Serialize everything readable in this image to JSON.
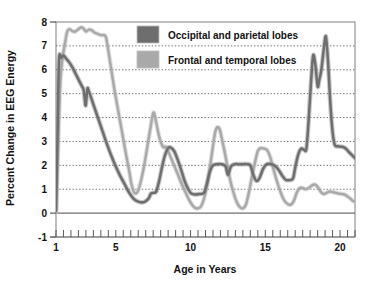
{
  "chart_data": {
    "type": "line",
    "title": "",
    "xlabel": "Age in Years",
    "ylabel": "Percent Change in EEG Energy",
    "xlim": [
      1,
      21
    ],
    "ylim": [
      -1,
      8
    ],
    "yticks": [
      -1,
      0,
      1,
      2,
      3,
      4,
      5,
      6,
      7,
      8
    ],
    "ytick_labels": [
      "-1",
      "0",
      "1",
      "2",
      "3",
      "4",
      "5",
      "6",
      "7",
      "8"
    ],
    "xticks": [
      1,
      5,
      10,
      15,
      20
    ],
    "xtick_labels": [
      "1",
      "5",
      "10",
      "15",
      "20"
    ],
    "x_minor_tick_step": 0.5,
    "grid": "horizontal-dotted",
    "legend_position": "top-center",
    "series": [
      {
        "name": "Occipital and parietal lobes",
        "color": "#6e6e6e",
        "halo_color": "#9a9a9a",
        "points": [
          [
            1.0,
            0.1
          ],
          [
            1.1,
            3.2
          ],
          [
            1.2,
            6.4
          ],
          [
            1.35,
            6.5
          ],
          [
            1.5,
            6.6
          ],
          [
            1.7,
            6.45
          ],
          [
            1.9,
            6.3
          ],
          [
            2.1,
            6.1
          ],
          [
            2.3,
            5.85
          ],
          [
            2.5,
            5.6
          ],
          [
            2.7,
            5.35
          ],
          [
            2.85,
            5.15
          ],
          [
            2.95,
            4.6
          ],
          [
            3.0,
            4.55
          ],
          [
            3.1,
            5.2
          ],
          [
            3.2,
            5.1
          ],
          [
            3.5,
            4.55
          ],
          [
            3.8,
            4.0
          ],
          [
            4.1,
            3.45
          ],
          [
            4.4,
            2.9
          ],
          [
            4.7,
            2.4
          ],
          [
            5.0,
            1.95
          ],
          [
            5.3,
            1.55
          ],
          [
            5.6,
            1.2
          ],
          [
            5.9,
            0.85
          ],
          [
            6.2,
            0.6
          ],
          [
            6.5,
            0.48
          ],
          [
            6.8,
            0.45
          ],
          [
            7.0,
            0.5
          ],
          [
            7.2,
            0.62
          ],
          [
            7.35,
            0.82
          ],
          [
            7.5,
            0.85
          ],
          [
            7.7,
            0.9
          ],
          [
            7.9,
            1.35
          ],
          [
            8.1,
            1.95
          ],
          [
            8.3,
            2.45
          ],
          [
            8.5,
            2.72
          ],
          [
            8.65,
            2.75
          ],
          [
            8.9,
            2.6
          ],
          [
            9.1,
            2.3
          ],
          [
            9.35,
            1.85
          ],
          [
            9.6,
            1.35
          ],
          [
            9.85,
            1.0
          ],
          [
            10.05,
            0.82
          ],
          [
            10.3,
            0.78
          ],
          [
            10.6,
            0.8
          ],
          [
            10.9,
            0.85
          ],
          [
            11.1,
            1.25
          ],
          [
            11.3,
            1.75
          ],
          [
            11.5,
            2.0
          ],
          [
            11.8,
            2.05
          ],
          [
            12.1,
            2.05
          ],
          [
            12.35,
            1.95
          ],
          [
            12.5,
            1.6
          ],
          [
            12.7,
            1.95
          ],
          [
            12.95,
            2.05
          ],
          [
            13.2,
            2.05
          ],
          [
            13.5,
            2.05
          ],
          [
            13.8,
            2.05
          ],
          [
            14.0,
            2.0
          ],
          [
            14.2,
            1.6
          ],
          [
            14.4,
            1.35
          ],
          [
            14.6,
            1.45
          ],
          [
            14.85,
            1.85
          ],
          [
            15.1,
            2.05
          ],
          [
            15.35,
            2.05
          ],
          [
            15.6,
            2.0
          ],
          [
            15.85,
            1.85
          ],
          [
            16.1,
            1.6
          ],
          [
            16.35,
            1.4
          ],
          [
            16.6,
            1.38
          ],
          [
            16.85,
            1.45
          ],
          [
            17.0,
            1.9
          ],
          [
            17.2,
            2.45
          ],
          [
            17.4,
            2.7
          ],
          [
            17.6,
            2.65
          ],
          [
            17.75,
            2.7
          ],
          [
            17.9,
            3.9
          ],
          [
            18.05,
            5.4
          ],
          [
            18.2,
            6.6
          ],
          [
            18.35,
            6.2
          ],
          [
            18.5,
            5.3
          ],
          [
            18.62,
            5.6
          ],
          [
            18.75,
            6.0
          ],
          [
            18.9,
            6.8
          ],
          [
            19.05,
            7.4
          ],
          [
            19.2,
            6.3
          ],
          [
            19.35,
            4.6
          ],
          [
            19.5,
            3.4
          ],
          [
            19.65,
            2.85
          ],
          [
            19.85,
            2.8
          ],
          [
            20.1,
            2.78
          ],
          [
            20.35,
            2.72
          ],
          [
            20.6,
            2.55
          ],
          [
            20.85,
            2.4
          ],
          [
            21.0,
            2.3
          ]
        ]
      },
      {
        "name": "Frontal and temporal lobes",
        "color": "#a9a9a9",
        "halo_color": "#c8c8c8",
        "points": [
          [
            1.0,
            0.05
          ],
          [
            1.1,
            2.0
          ],
          [
            1.2,
            4.0
          ],
          [
            1.3,
            5.6
          ],
          [
            1.45,
            6.55
          ],
          [
            1.6,
            7.1
          ],
          [
            1.75,
            7.6
          ],
          [
            1.9,
            7.7
          ],
          [
            2.1,
            7.62
          ],
          [
            2.3,
            7.6
          ],
          [
            2.5,
            7.7
          ],
          [
            2.7,
            7.78
          ],
          [
            2.85,
            7.72
          ],
          [
            3.0,
            7.6
          ],
          [
            3.2,
            7.68
          ],
          [
            3.4,
            7.65
          ],
          [
            3.6,
            7.55
          ],
          [
            3.8,
            7.5
          ],
          [
            4.0,
            7.45
          ],
          [
            4.2,
            7.45
          ],
          [
            4.35,
            7.35
          ],
          [
            4.5,
            6.8
          ],
          [
            4.7,
            6.0
          ],
          [
            4.9,
            5.2
          ],
          [
            5.1,
            4.5
          ],
          [
            5.3,
            3.8
          ],
          [
            5.5,
            3.1
          ],
          [
            5.7,
            2.4
          ],
          [
            5.9,
            1.75
          ],
          [
            6.05,
            1.2
          ],
          [
            6.2,
            0.9
          ],
          [
            6.35,
            0.82
          ],
          [
            6.5,
            0.95
          ],
          [
            6.7,
            1.4
          ],
          [
            6.9,
            2.0
          ],
          [
            7.1,
            2.75
          ],
          [
            7.3,
            3.5
          ],
          [
            7.45,
            4.05
          ],
          [
            7.55,
            4.2
          ],
          [
            7.7,
            3.8
          ],
          [
            7.9,
            3.2
          ],
          [
            8.05,
            2.9
          ],
          [
            8.2,
            2.75
          ],
          [
            8.35,
            2.78
          ],
          [
            8.5,
            2.6
          ],
          [
            8.7,
            2.3
          ],
          [
            8.9,
            2.0
          ],
          [
            9.1,
            1.7
          ],
          [
            9.35,
            1.3
          ],
          [
            9.6,
            0.95
          ],
          [
            9.85,
            0.62
          ],
          [
            10.1,
            0.35
          ],
          [
            10.3,
            0.22
          ],
          [
            10.5,
            0.2
          ],
          [
            10.7,
            0.28
          ],
          [
            10.9,
            0.6
          ],
          [
            11.1,
            1.15
          ],
          [
            11.3,
            1.95
          ],
          [
            11.5,
            2.8
          ],
          [
            11.65,
            3.4
          ],
          [
            11.8,
            3.6
          ],
          [
            11.95,
            3.5
          ],
          [
            12.1,
            3.1
          ],
          [
            12.3,
            2.5
          ],
          [
            12.5,
            1.85
          ],
          [
            12.7,
            1.25
          ],
          [
            12.9,
            0.8
          ],
          [
            13.1,
            0.45
          ],
          [
            13.3,
            0.25
          ],
          [
            13.5,
            0.2
          ],
          [
            13.7,
            0.35
          ],
          [
            13.9,
            0.85
          ],
          [
            14.1,
            1.5
          ],
          [
            14.3,
            2.1
          ],
          [
            14.5,
            2.6
          ],
          [
            14.7,
            2.72
          ],
          [
            14.9,
            2.7
          ],
          [
            15.1,
            2.65
          ],
          [
            15.3,
            2.4
          ],
          [
            15.5,
            1.95
          ],
          [
            15.7,
            1.5
          ],
          [
            15.9,
            1.1
          ],
          [
            16.1,
            0.75
          ],
          [
            16.3,
            0.5
          ],
          [
            16.5,
            0.38
          ],
          [
            16.7,
            0.35
          ],
          [
            16.9,
            0.5
          ],
          [
            17.1,
            0.85
          ],
          [
            17.3,
            1.05
          ],
          [
            17.5,
            1.05
          ],
          [
            17.7,
            1.0
          ],
          [
            17.9,
            1.05
          ],
          [
            18.1,
            1.15
          ],
          [
            18.3,
            1.2
          ],
          [
            18.5,
            1.1
          ],
          [
            18.7,
            0.9
          ],
          [
            18.9,
            0.8
          ],
          [
            19.1,
            0.85
          ],
          [
            19.3,
            0.9
          ],
          [
            19.5,
            0.88
          ],
          [
            19.7,
            0.85
          ],
          [
            19.9,
            0.82
          ],
          [
            20.1,
            0.8
          ],
          [
            20.3,
            0.78
          ],
          [
            20.5,
            0.7
          ],
          [
            20.7,
            0.6
          ],
          [
            20.85,
            0.52
          ],
          [
            21.0,
            0.48
          ]
        ]
      }
    ],
    "legend": [
      {
        "label": "Occipital and parietal lobes",
        "color": "#6e6e6e"
      },
      {
        "label": "Frontal and temporal lobes",
        "color": "#a9a9a9"
      }
    ]
  },
  "colors": {
    "axis": "#7a7a7a",
    "grid": "#555555",
    "text": "#111111",
    "background": "#ffffff",
    "frame": "#8a8a8a"
  }
}
